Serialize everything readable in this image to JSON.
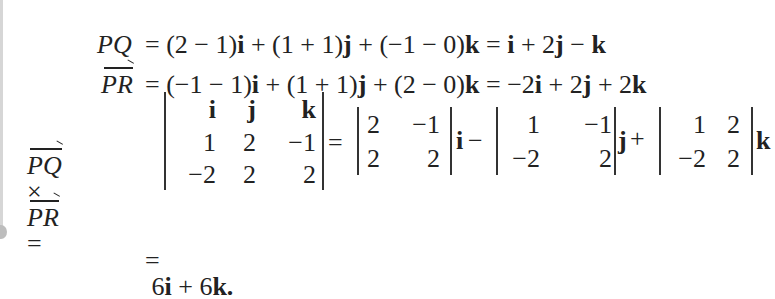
{
  "equations": {
    "line1": {
      "lhs": "PQ",
      "rhs": "= (2 − 1)i + (1 + 1)j + (−1 − 0)k = i + 2j − k"
    },
    "line2": {
      "lhs": "PR",
      "rhs": "= (−1 − 1)i + (1 + 1)j + (2 − 0)k = −2i + 2j + 2k"
    },
    "line3": {
      "lhs_a": "PQ",
      "times": "×",
      "lhs_b": "PR",
      "eq": "=",
      "det3": {
        "row1": [
          "i",
          "j",
          "k"
        ],
        "row2": [
          "1",
          "2",
          "−1"
        ],
        "row3": [
          "−2",
          "2",
          "2"
        ]
      },
      "eq2": "=",
      "minor_i": {
        "row1": [
          "2",
          "−1"
        ],
        "row2": [
          "2",
          "2"
        ]
      },
      "unit_i": "i",
      "minus": "−",
      "minor_j": {
        "row1": [
          "1",
          "−1"
        ],
        "row2": [
          "−2",
          "2"
        ]
      },
      "unit_j": "j",
      "plus": "+",
      "minor_k": {
        "row1": [
          "1",
          "2"
        ],
        "row2": [
          "−2",
          "2"
        ]
      },
      "unit_k": "k"
    },
    "line4": {
      "eq": "=",
      "result": "6i + 6k."
    }
  }
}
